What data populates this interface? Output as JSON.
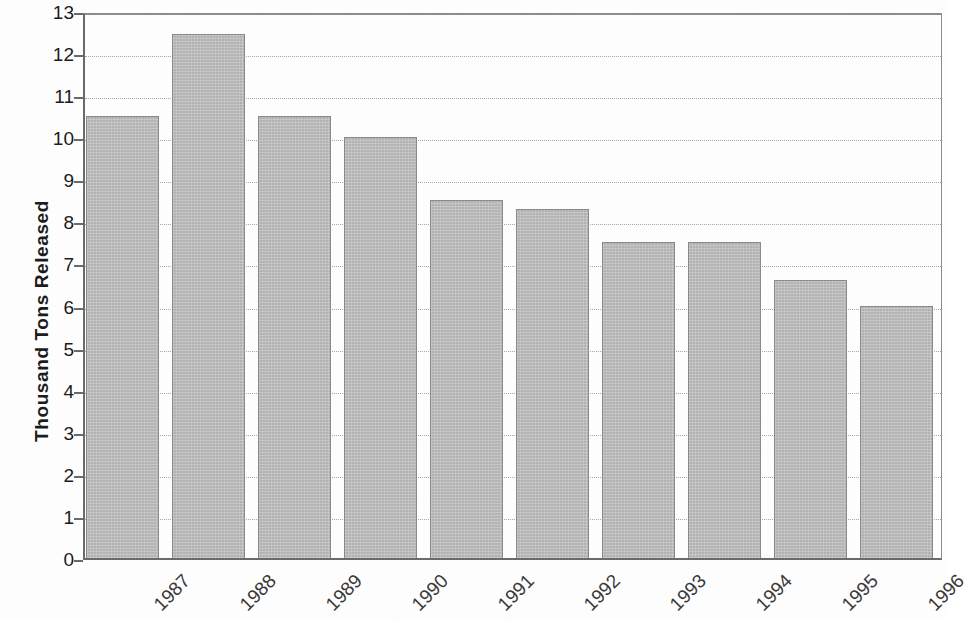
{
  "chart_data": {
    "type": "bar",
    "title": "",
    "subtitle": "",
    "xlabel": "",
    "ylabel": "Thousand Tons Released",
    "categories": [
      "1987",
      "1988",
      "1989",
      "1990",
      "1991",
      "1992",
      "1993",
      "1994",
      "1995",
      "1996"
    ],
    "values": [
      10.5,
      12.45,
      10.5,
      10.0,
      8.5,
      8.3,
      7.5,
      7.5,
      6.6,
      6.0
    ],
    "series": [
      {
        "name": "Thousand Tons Released",
        "values": [
          10.5,
          12.45,
          10.5,
          10.0,
          8.5,
          8.3,
          7.5,
          7.5,
          6.6,
          6.0
        ]
      }
    ],
    "ylim": [
      0,
      13
    ],
    "ytick_step": 1,
    "yticks": [
      0,
      1,
      2,
      3,
      4,
      5,
      6,
      7,
      8,
      9,
      10,
      11,
      12,
      13
    ],
    "ytick_labels": [
      "0",
      "1",
      "2",
      "3",
      "4",
      "5",
      "6",
      "7",
      "8",
      "9",
      "10",
      "11",
      "12",
      "13"
    ],
    "grid": true,
    "grid_axis": "y",
    "grid_style": "dotted",
    "legend": false,
    "legend_position": "none",
    "xtick_rotation": -45,
    "bar_color": "#bcbcbc",
    "bar_border_color": "#8a8a8a",
    "axis_color": "#6b6b6b",
    "gridline_color": "#a8a8a8",
    "background_color": "#ffffff",
    "annotations": []
  }
}
